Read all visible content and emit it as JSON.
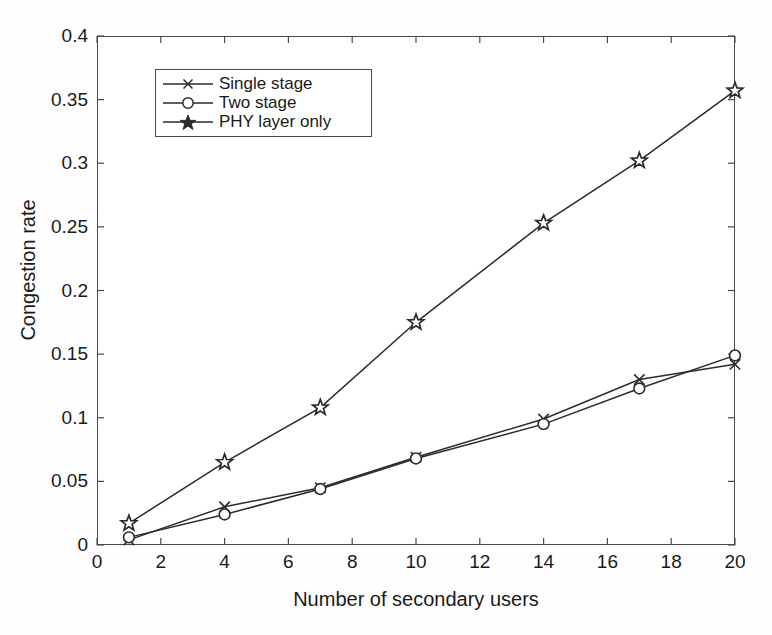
{
  "figure": {
    "background_color": "#ffffff",
    "line_color": "#2b2b2b",
    "axis_color": "#4a4a4a"
  },
  "chart_data": {
    "type": "line",
    "title": "",
    "xlabel": "Number of secondary users",
    "ylabel": "Congestion rate",
    "xlim": [
      0,
      20
    ],
    "ylim": [
      0,
      0.4
    ],
    "xticks": [
      0,
      2,
      4,
      6,
      8,
      10,
      12,
      14,
      16,
      18,
      20
    ],
    "xtick_labels": [
      "0",
      "2",
      "4",
      "6",
      "8",
      "10",
      "12",
      "14",
      "16",
      "18",
      "20"
    ],
    "yticks": [
      0,
      0.05,
      0.1,
      0.15,
      0.2,
      0.25,
      0.3,
      0.35,
      0.4
    ],
    "ytick_labels": [
      "0",
      "0.05",
      "0.1",
      "0.15",
      "0.2",
      "0.25",
      "0.3",
      "0.35",
      "0.4"
    ],
    "grid": false,
    "legend_position": "upper left",
    "x": [
      1,
      4,
      7,
      10,
      14,
      17,
      20
    ],
    "series": [
      {
        "name": "Single stage",
        "marker": "x",
        "color": "#2b2b2b",
        "values": [
          0.004,
          0.03,
          0.045,
          0.069,
          0.099,
          0.13,
          0.142
        ]
      },
      {
        "name": "Two stage",
        "marker": "o",
        "color": "#2b2b2b",
        "values": [
          0.006,
          0.024,
          0.044,
          0.068,
          0.095,
          0.123,
          0.149
        ]
      },
      {
        "name": "PHY layer only",
        "marker": "star",
        "color": "#2b2b2b",
        "values": [
          0.017,
          0.065,
          0.108,
          0.175,
          0.253,
          0.302,
          0.357
        ]
      }
    ]
  },
  "legend": {
    "items": [
      {
        "label": "Single stage",
        "marker": "x"
      },
      {
        "label": "Two stage",
        "marker": "o"
      },
      {
        "label": "PHY layer only",
        "marker": "star"
      }
    ]
  }
}
